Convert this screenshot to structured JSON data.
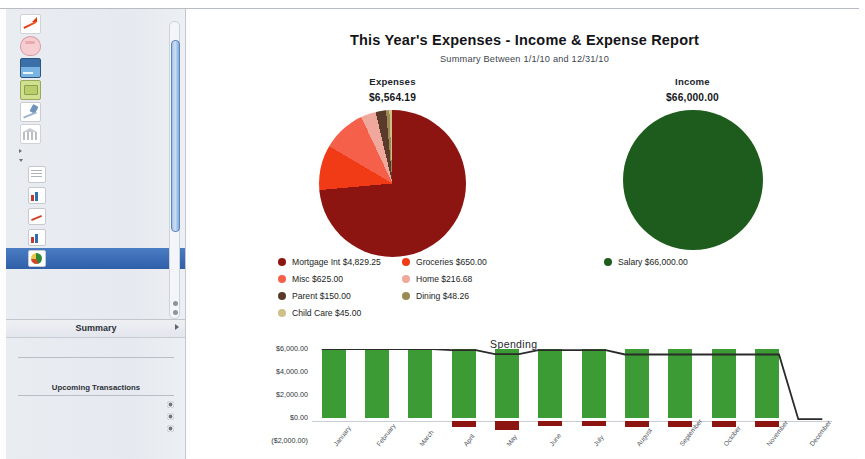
{
  "sidebar": {
    "accounts": [
      {
        "name": "Brokerage",
        "balance": "$20,586.99",
        "icon": "brokerage-icon"
      },
      {
        "name": "Home Savings",
        "balance": "$580.00",
        "icon": "piggy-bank-icon"
      },
      {
        "name": "Primary Visa",
        "balance": "($1,692.78)",
        "icon": "credit-card-icon"
      },
      {
        "name": "Spending Cash",
        "balance": "($3,217.64)",
        "icon": "cash-icon"
      },
      {
        "name": "Joint Checking",
        "balance": "$78,100.79",
        "icon": "checkbook-icon"
      },
      {
        "name": "Home Mortgage",
        "balance": "($141,519.21)",
        "icon": "bank-icon"
      }
    ],
    "groups": [
      {
        "label": "WEBSITES",
        "expanded": false
      },
      {
        "label": "REPORTS",
        "expanded": true
      }
    ],
    "reports": [
      {
        "name": "Loans - Payoff Schedules",
        "subtitle": "Debt/Liability",
        "icon": "grid-report-icon",
        "selected": false
      },
      {
        "name": "Net Worth",
        "subtitle": "Net Worth",
        "icon": "bar-report-icon",
        "selected": false
      },
      {
        "name": "Portfolio",
        "subtitle": "Portfolio Summary",
        "icon": "line-report-icon",
        "selected": false
      },
      {
        "name": "Savings Forecast",
        "subtitle": "Net Worth",
        "icon": "bar-report-icon",
        "selected": false
      },
      {
        "name": "This Year's Expenses",
        "subtitle": "Income & Expense",
        "icon": "pie-report-icon",
        "selected": true
      }
    ],
    "summary": {
      "title": "Summary",
      "rows": [
        {
          "label": "Money you have",
          "value": "$99,277.78"
        },
        {
          "label": "Money you owe",
          "value": "($146,229.67)"
        },
        {
          "label": "Total",
          "value": "($46,951.89)"
        }
      ],
      "upcoming_title": "Upcoming Transactions",
      "upcoming": [
        {
          "text": "11/16/10 Salary $6,000.00"
        },
        {
          "text": "11/28/10 Trader Joes ($65.00)"
        },
        {
          "text": "12/1/10 Wells Fargo ($762.32)"
        }
      ]
    }
  },
  "report": {
    "title": "This Year's Expenses - Income & Expense Report",
    "subtitle": "Summary Between 1/1/10 and 12/31/10",
    "expenses_caption": "Expenses",
    "expenses_total": "$6,564.19",
    "income_caption": "Income",
    "income_total": "$66,000.00"
  },
  "chart_data": [
    {
      "type": "pie",
      "title": "Expenses",
      "total": 6564.19,
      "total_label": "$6,564.19",
      "legend_position": "bottom",
      "slices": [
        {
          "label": "Mortgage Int",
          "value": 4829.25,
          "value_label": "$4,829.25",
          "color": "#8c1512"
        },
        {
          "label": "Groceries",
          "value": 650.0,
          "value_label": "$650.00",
          "color": "#f03b16"
        },
        {
          "label": "Misc",
          "value": 625.0,
          "value_label": "$625.00",
          "color": "#f4604a"
        },
        {
          "label": "Home",
          "value": 216.68,
          "value_label": "$216.68",
          "color": "#f0a89c"
        },
        {
          "label": "Parent",
          "value": 150.0,
          "value_label": "$150.00",
          "color": "#5a3a2a"
        },
        {
          "label": "Dining",
          "value": 48.26,
          "value_label": "$48.26",
          "color": "#9c8a54"
        },
        {
          "label": "Child Care",
          "value": 45.0,
          "value_label": "$45.00",
          "color": "#cfc08a"
        }
      ]
    },
    {
      "type": "pie",
      "title": "Income",
      "total": 66000.0,
      "total_label": "$66,000.00",
      "legend_position": "bottom",
      "slices": [
        {
          "label": "Salary",
          "value": 66000.0,
          "value_label": "$66,000.00",
          "color": "#1d5c1c"
        }
      ]
    },
    {
      "type": "bar",
      "title": "Spending",
      "categories": [
        "January",
        "February",
        "March",
        "April",
        "May",
        "June",
        "July",
        "August",
        "September",
        "October",
        "November",
        "December"
      ],
      "ylim": [
        -2000,
        6000
      ],
      "yticks": [
        6000,
        4000,
        2000,
        0,
        -2000
      ],
      "ytick_labels": [
        "$6,000.00",
        "$4,000.00",
        "$2,000.00",
        "$0.00",
        "($2,000.00)"
      ],
      "grid": false,
      "series": [
        {
          "name": "Income",
          "type": "bar",
          "color": "#3d9b35",
          "values": [
            6000,
            6000,
            6000,
            6000,
            6000,
            6000,
            6000,
            6000,
            6000,
            6000,
            6000,
            0
          ]
        },
        {
          "name": "Expenses",
          "type": "bar",
          "color": "#8c1512",
          "values": [
            0,
            0,
            0,
            -480,
            -760,
            -420,
            -400,
            -520,
            -520,
            -520,
            -520,
            0
          ]
        },
        {
          "name": "Spending",
          "type": "line",
          "color": "#2a2a2a",
          "values": [
            6000,
            6000,
            6000,
            5900,
            5550,
            5900,
            5900,
            5520,
            5520,
            5520,
            5520,
            -100
          ]
        }
      ]
    }
  ]
}
